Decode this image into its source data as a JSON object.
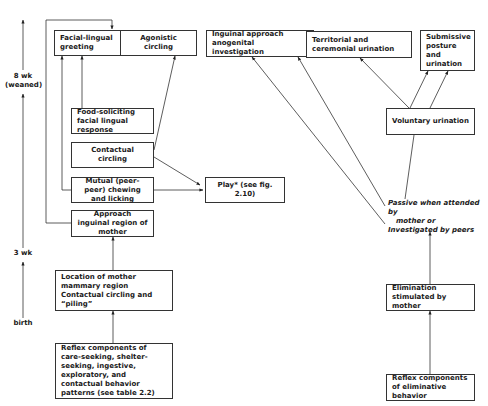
{
  "timeline": {
    "labels": [
      {
        "id": "weaned",
        "line1": "8 wk",
        "line2": "(weaned)"
      },
      {
        "id": "3wk",
        "line1": "3 wk"
      },
      {
        "id": "birth",
        "line1": "birth"
      }
    ]
  },
  "boxes": {
    "facial_lingual_greeting": "Facial-lingual greeting",
    "agonistic_circling": "Agonistic circling",
    "inguinal_approach": "Inguinal approach anogenital investigation",
    "territorial_urination": "Territorial and ceremonial urination",
    "submissive_posture": "Submissive posture and urination",
    "food_soliciting": "Food-soliciting facial lingual response",
    "contactual_circling": "Contactual circling",
    "mutual_chewing": "Mutual (peer-peer) chewing and licking",
    "play": "Play* (see fig. 2.10)",
    "approach_inguinal_mother": "Approach inguinal region of mother",
    "location_of_mother": "Location of mother mammary region Contactual circling and “piling”",
    "reflex_components": "Reflex components of care-seeking, shelter-seeking, ingestive, exploratory, and contactual behavior patterns (see table 2.2)",
    "voluntary_urination": "Voluntary urination",
    "elimination_stimulated": "Elimination stimulated by mother",
    "reflex_eliminative": "Reflex components of eliminative behavior"
  },
  "passive_note": {
    "word1": "Passive",
    "rest1": " when attended by",
    "line2": "mother or",
    "word3": "Investigated",
    "rest3": " by peers"
  }
}
